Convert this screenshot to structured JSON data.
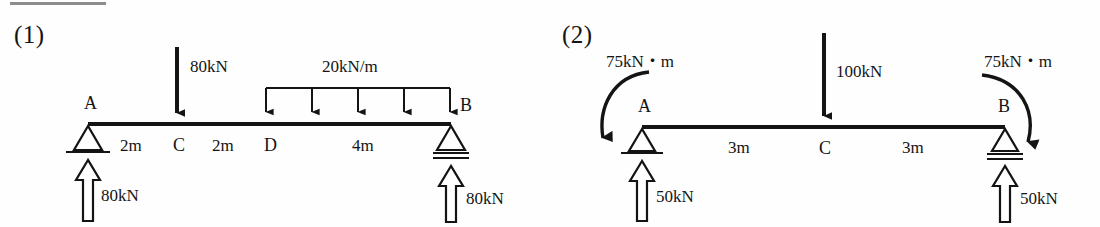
{
  "page": {
    "top_rule": true,
    "ink_color": "#141414"
  },
  "figures": [
    {
      "id": "fig1",
      "label": "(1)",
      "beam": {
        "span_label": "A to B",
        "points": [
          "A",
          "C",
          "D",
          "B"
        ]
      },
      "nodes": [
        {
          "name": "A",
          "label": "A"
        },
        {
          "name": "C",
          "label": "C"
        },
        {
          "name": "D",
          "label": "D"
        },
        {
          "name": "B",
          "label": "B"
        }
      ],
      "supports": [
        {
          "at": "A",
          "type": "pin"
        },
        {
          "at": "B",
          "type": "roller"
        }
      ],
      "dimensions": [
        {
          "label": "2m",
          "from": "A",
          "to": "C"
        },
        {
          "label": "2m",
          "from": "C",
          "to": "D"
        },
        {
          "label": "4m",
          "from": "D",
          "to": "B"
        }
      ],
      "point_loads": [
        {
          "at": "C",
          "label": "80kN",
          "direction": "down"
        }
      ],
      "distributed_loads": [
        {
          "label": "20kN/m",
          "from": "D",
          "to": "B",
          "direction": "down",
          "arrows": 5
        }
      ],
      "reactions": [
        {
          "at": "A",
          "label": "80kN",
          "direction": "up"
        },
        {
          "at": "B",
          "label": "80kN",
          "direction": "up"
        }
      ],
      "moments": []
    },
    {
      "id": "fig2",
      "label": "(2)",
      "beam": {
        "span_label": "A to B",
        "points": [
          "A",
          "C",
          "B"
        ]
      },
      "nodes": [
        {
          "name": "A",
          "label": "A"
        },
        {
          "name": "C",
          "label": "C"
        },
        {
          "name": "B",
          "label": "B"
        }
      ],
      "supports": [
        {
          "at": "A",
          "type": "pin"
        },
        {
          "at": "B",
          "type": "roller"
        }
      ],
      "dimensions": [
        {
          "label": "3m",
          "from": "A",
          "to": "C"
        },
        {
          "label": "3m",
          "from": "C",
          "to": "B"
        }
      ],
      "point_loads": [
        {
          "at": "C",
          "label": "100kN",
          "direction": "down"
        }
      ],
      "distributed_loads": [],
      "reactions": [
        {
          "at": "A",
          "label": "50kN",
          "direction": "up"
        },
        {
          "at": "B",
          "label": "50kN",
          "direction": "up"
        }
      ],
      "moments": [
        {
          "at": "A",
          "label": "75kN・m",
          "sense": "clockwise"
        },
        {
          "at": "B",
          "label": "75kN・m",
          "sense": "clockwise"
        }
      ]
    }
  ]
}
